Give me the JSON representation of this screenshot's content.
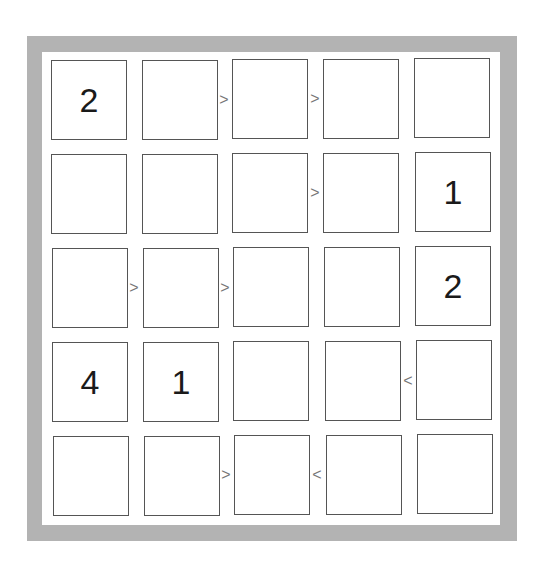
{
  "puzzle": {
    "type": "futoshiki",
    "size": 5,
    "grid": [
      [
        "2",
        "",
        "",
        "",
        ""
      ],
      [
        "",
        "",
        "",
        "",
        "1"
      ],
      [
        "",
        "",
        "",
        "",
        "2"
      ],
      [
        "4",
        "1",
        "",
        "",
        ""
      ],
      [
        "",
        "",
        "",
        "",
        ""
      ]
    ],
    "horizontal_inequalities": [
      {
        "row": 0,
        "between": [
          1,
          2
        ],
        "symbol": ">"
      },
      {
        "row": 0,
        "between": [
          2,
          3
        ],
        "symbol": ">"
      },
      {
        "row": 1,
        "between": [
          2,
          3
        ],
        "symbol": ">"
      },
      {
        "row": 2,
        "between": [
          0,
          1
        ],
        "symbol": ">"
      },
      {
        "row": 2,
        "between": [
          1,
          2
        ],
        "symbol": ">"
      },
      {
        "row": 3,
        "between": [
          3,
          4
        ],
        "symbol": "<"
      },
      {
        "row": 4,
        "between": [
          1,
          2
        ],
        "symbol": ">"
      },
      {
        "row": 4,
        "between": [
          2,
          3
        ],
        "symbol": "<"
      }
    ]
  },
  "colors": {
    "frame": "#b3b3b3",
    "cell_border": "#555555",
    "digit": "#1a1a1a",
    "inequality": "#777777"
  }
}
